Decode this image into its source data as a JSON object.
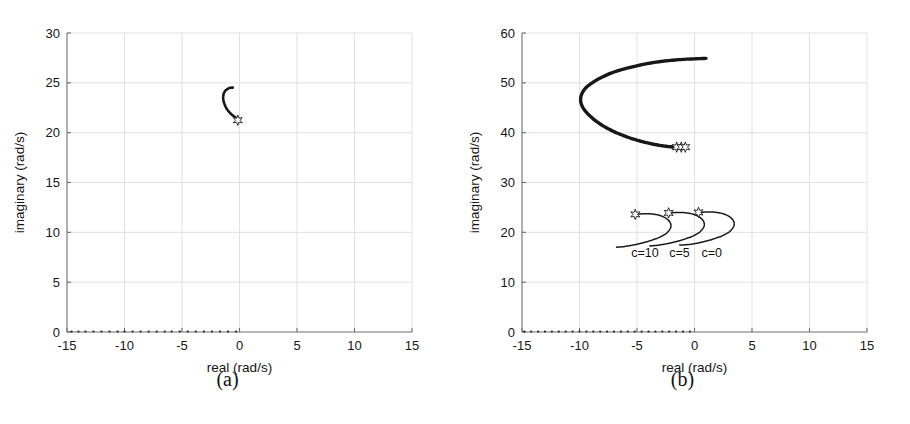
{
  "figure": {
    "background": "#ffffff",
    "ink_color": "#171717",
    "grid_color": "#dedede",
    "axis_color": "#6e6e6e"
  },
  "panels": [
    {
      "id": "panel-a",
      "caption": "(a)",
      "chart_data": {
        "type": "scatter",
        "title": "",
        "xlabel": "real (rad/s)",
        "ylabel": "imaginary (rad/s)",
        "xlim": [
          -15,
          15
        ],
        "ylim": [
          0,
          30
        ],
        "xticks": [
          -15,
          -10,
          -5,
          0,
          5,
          10,
          15
        ],
        "xticklabels": [
          "-15",
          "-10",
          "-5",
          "0",
          "5",
          "10",
          "15"
        ],
        "yticks": [
          0,
          5,
          10,
          15,
          20,
          25,
          30
        ],
        "yticklabels": [
          "0",
          "5",
          "10",
          "15",
          "20",
          "25",
          "30"
        ],
        "grid": true,
        "legend": "none",
        "series": [
          {
            "name": "root-locus-branch",
            "style": "dotted-curve",
            "marker": "none",
            "points": [
              [
                -0.1,
                21.35
              ],
              [
                -0.38,
                21.55
              ],
              [
                -0.66,
                21.8
              ],
              [
                -0.92,
                22.1
              ],
              [
                -1.14,
                22.45
              ],
              [
                -1.3,
                22.85
              ],
              [
                -1.4,
                23.25
              ],
              [
                -1.42,
                23.62
              ],
              [
                -1.36,
                23.95
              ],
              [
                -1.22,
                24.22
              ],
              [
                -1.02,
                24.4
              ],
              [
                -0.8,
                24.5
              ],
              [
                -0.58,
                24.52
              ]
            ]
          },
          {
            "name": "real-axis-branch",
            "style": "dotted-points",
            "marker": "none",
            "points": [
              [
                -14.6,
                0.05
              ],
              [
                -14.0,
                0.05
              ],
              [
                -13.4,
                0.05
              ],
              [
                -12.7,
                0.05
              ],
              [
                -12.0,
                0.05
              ],
              [
                -11.3,
                0.05
              ],
              [
                -10.6,
                0.05
              ],
              [
                -10.0,
                0.05
              ],
              [
                -9.3,
                0.05
              ],
              [
                -8.6,
                0.05
              ],
              [
                -7.9,
                0.05
              ],
              [
                -7.2,
                0.05
              ],
              [
                -6.5,
                0.05
              ],
              [
                -5.9,
                0.05
              ],
              [
                -5.2,
                0.05
              ],
              [
                -4.5,
                0.05
              ],
              [
                -3.8,
                0.05
              ],
              [
                -3.1,
                0.05
              ],
              [
                -2.4,
                0.05
              ],
              [
                -1.7,
                0.05
              ],
              [
                -1.0,
                0.05
              ],
              [
                -0.3,
                0.05
              ]
            ]
          }
        ],
        "markers": [
          {
            "name": "open-loop-pole",
            "glyph": "star",
            "x": -0.15,
            "y": 21.25
          }
        ],
        "annotations": []
      }
    },
    {
      "id": "panel-b",
      "caption": "(b)",
      "chart_data": {
        "type": "scatter",
        "title": "",
        "xlabel": "real (rad/s)",
        "ylabel": "imaginary (rad/s)",
        "xlim": [
          -15,
          15
        ],
        "ylim": [
          0,
          60
        ],
        "xticks": [
          -15,
          -10,
          -5,
          0,
          5,
          10,
          15
        ],
        "xticklabels": [
          "-15",
          "-10",
          "-5",
          "0",
          "5",
          "10",
          "15"
        ],
        "yticks": [
          0,
          10,
          20,
          30,
          40,
          50,
          60
        ],
        "yticklabels": [
          "0",
          "10",
          "20",
          "30",
          "40",
          "50",
          "60"
        ],
        "grid": true,
        "legend": "none",
        "series": [
          {
            "name": "upper-branch-thick",
            "style": "thick-curve",
            "marker": "none",
            "points": [
              [
                -1.2,
                37.0
              ],
              [
                -2.6,
                37.3
              ],
              [
                -4.0,
                37.9
              ],
              [
                -5.3,
                38.7
              ],
              [
                -6.5,
                39.7
              ],
              [
                -7.6,
                40.9
              ],
              [
                -8.5,
                42.2
              ],
              [
                -9.2,
                43.6
              ],
              [
                -9.7,
                45.0
              ],
              [
                -9.9,
                46.4
              ],
              [
                -9.8,
                47.8
              ],
              [
                -9.4,
                49.1
              ],
              [
                -8.7,
                50.3
              ],
              [
                -7.8,
                51.4
              ],
              [
                -6.7,
                52.4
              ],
              [
                -5.4,
                53.2
              ],
              [
                -4.0,
                53.9
              ],
              [
                -2.5,
                54.4
              ],
              [
                -1.0,
                54.7
              ],
              [
                0.4,
                54.85
              ],
              [
                1.0,
                54.9
              ]
            ]
          },
          {
            "name": "lower-branch-c10",
            "label": "c=10",
            "style": "thin-curve",
            "marker": "none",
            "points": [
              [
                -5.1,
                23.6
              ],
              [
                -4.2,
                23.75
              ],
              [
                -3.4,
                23.6
              ],
              [
                -2.8,
                23.2
              ],
              [
                -2.35,
                22.6
              ],
              [
                -2.1,
                21.9
              ],
              [
                -2.05,
                21.15
              ],
              [
                -2.2,
                20.4
              ],
              [
                -2.5,
                19.7
              ],
              [
                -3.0,
                19.05
              ],
              [
                -3.6,
                18.5
              ],
              [
                -4.3,
                18.0
              ],
              [
                -5.0,
                17.6
              ],
              [
                -5.7,
                17.3
              ],
              [
                -6.3,
                17.1
              ],
              [
                -6.8,
                17.0
              ]
            ]
          },
          {
            "name": "lower-branch-c5",
            "label": "c=5",
            "style": "thin-curve",
            "marker": "none",
            "points": [
              [
                -2.2,
                23.9
              ],
              [
                -1.3,
                24.0
              ],
              [
                -0.5,
                23.85
              ],
              [
                0.1,
                23.45
              ],
              [
                0.55,
                22.85
              ],
              [
                0.8,
                22.15
              ],
              [
                0.85,
                21.4
              ],
              [
                0.7,
                20.65
              ],
              [
                0.4,
                19.95
              ],
              [
                -0.1,
                19.3
              ],
              [
                -0.7,
                18.75
              ],
              [
                -1.4,
                18.25
              ],
              [
                -2.1,
                17.85
              ],
              [
                -2.8,
                17.55
              ],
              [
                -3.4,
                17.35
              ],
              [
                -3.9,
                17.25
              ]
            ]
          },
          {
            "name": "lower-branch-c0",
            "label": "c=0",
            "style": "thin-curve",
            "marker": "none",
            "points": [
              [
                0.4,
                24.0
              ],
              [
                1.3,
                24.1
              ],
              [
                2.1,
                23.95
              ],
              [
                2.7,
                23.55
              ],
              [
                3.15,
                22.95
              ],
              [
                3.4,
                22.25
              ],
              [
                3.45,
                21.5
              ],
              [
                3.3,
                20.75
              ],
              [
                3.0,
                20.05
              ],
              [
                2.5,
                19.4
              ],
              [
                1.9,
                18.85
              ],
              [
                1.2,
                18.35
              ],
              [
                0.5,
                17.95
              ],
              [
                -0.2,
                17.65
              ],
              [
                -0.8,
                17.5
              ],
              [
                -1.3,
                17.45
              ]
            ]
          },
          {
            "name": "real-axis-branch",
            "style": "dotted-points",
            "marker": "none",
            "points": [
              [
                -14.8,
                0.1
              ],
              [
                -14.2,
                0.1
              ],
              [
                -13.6,
                0.1
              ],
              [
                -13.0,
                0.1
              ],
              [
                -12.4,
                0.1
              ],
              [
                -11.8,
                0.1
              ],
              [
                -11.2,
                0.1
              ],
              [
                -10.6,
                0.1
              ],
              [
                -10.0,
                0.1
              ],
              [
                -9.4,
                0.1
              ],
              [
                -8.8,
                0.1
              ],
              [
                -8.2,
                0.1
              ],
              [
                -7.6,
                0.1
              ],
              [
                -7.0,
                0.1
              ],
              [
                -6.4,
                0.1
              ],
              [
                -5.8,
                0.1
              ],
              [
                -5.2,
                0.1
              ],
              [
                -4.6,
                0.1
              ],
              [
                -4.0,
                0.1
              ],
              [
                -3.4,
                0.1
              ],
              [
                -2.8,
                0.1
              ],
              [
                -2.2,
                0.1
              ],
              [
                -1.6,
                0.1
              ],
              [
                -1.0,
                0.1
              ],
              [
                -0.4,
                0.1
              ]
            ]
          }
        ],
        "markers": [
          {
            "name": "pole-cluster-upper-1",
            "glyph": "star",
            "x": -1.55,
            "y": 37.1
          },
          {
            "name": "pole-cluster-upper-2",
            "glyph": "star",
            "x": -1.15,
            "y": 37.1
          },
          {
            "name": "pole-cluster-upper-3",
            "glyph": "star",
            "x": -0.8,
            "y": 37.1
          },
          {
            "name": "pole-c10",
            "glyph": "star",
            "x": -5.15,
            "y": 23.6
          },
          {
            "name": "pole-c5",
            "glyph": "star",
            "x": -2.25,
            "y": 23.9
          },
          {
            "name": "pole-c0",
            "glyph": "star",
            "x": 0.35,
            "y": 24.0
          }
        ],
        "annotations": [
          {
            "name": "curve-label-c10",
            "text": "c=10",
            "x": -4.3,
            "y": 15.0
          },
          {
            "name": "curve-label-c5",
            "text": "c=5",
            "x": -1.3,
            "y": 15.0
          },
          {
            "name": "curve-label-c0",
            "text": "c=0",
            "x": 1.5,
            "y": 15.0
          }
        ]
      }
    }
  ]
}
